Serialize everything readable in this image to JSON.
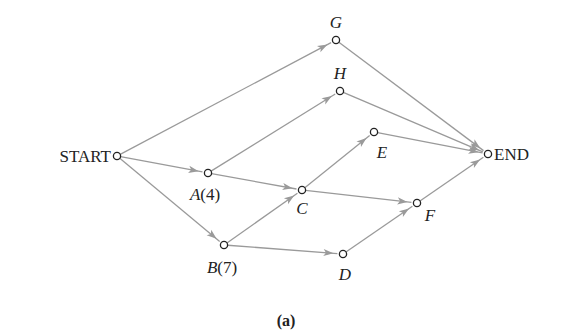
{
  "caption": "(a)",
  "colors": {
    "edge": "#9a9a9a",
    "node_stroke": "#222222",
    "text": "#222222"
  },
  "nodes": [
    {
      "id": "START",
      "label": "START",
      "x": 117,
      "y": 156,
      "lx": 111,
      "ly": 162,
      "anchor": "end",
      "italic": false
    },
    {
      "id": "G",
      "label": "G",
      "x": 336,
      "y": 40,
      "lx": 336,
      "ly": 28,
      "anchor": "middle",
      "italic": true
    },
    {
      "id": "H",
      "label": "H",
      "x": 340,
      "y": 91,
      "lx": 340,
      "ly": 79,
      "anchor": "middle",
      "italic": true
    },
    {
      "id": "E",
      "label": "E",
      "x": 374,
      "y": 132,
      "lx": 382,
      "ly": 158,
      "anchor": "middle",
      "italic": true
    },
    {
      "id": "END",
      "label": "END",
      "x": 488,
      "y": 154,
      "lx": 494,
      "ly": 160,
      "anchor": "start",
      "italic": false
    },
    {
      "id": "A",
      "label": "A",
      "weight": "(4)",
      "x": 208,
      "y": 173,
      "lx": 205,
      "ly": 200,
      "anchor": "middle",
      "italic": true
    },
    {
      "id": "C",
      "label": "C",
      "x": 302,
      "y": 190,
      "lx": 302,
      "ly": 214,
      "anchor": "middle",
      "italic": true
    },
    {
      "id": "F",
      "label": "F",
      "x": 417,
      "y": 203,
      "lx": 430,
      "ly": 221,
      "anchor": "middle",
      "italic": true
    },
    {
      "id": "B",
      "label": "B",
      "weight": "(7)",
      "x": 224,
      "y": 245,
      "lx": 222,
      "ly": 273,
      "anchor": "middle",
      "italic": true
    },
    {
      "id": "D",
      "label": "D",
      "x": 343,
      "y": 254,
      "lx": 345,
      "ly": 280,
      "anchor": "middle",
      "italic": true
    }
  ],
  "edges": [
    [
      "START",
      "G"
    ],
    [
      "START",
      "A"
    ],
    [
      "START",
      "B"
    ],
    [
      "A",
      "H"
    ],
    [
      "A",
      "C"
    ],
    [
      "B",
      "C"
    ],
    [
      "B",
      "D"
    ],
    [
      "C",
      "E"
    ],
    [
      "C",
      "F"
    ],
    [
      "D",
      "F"
    ],
    [
      "G",
      "END"
    ],
    [
      "H",
      "END"
    ],
    [
      "E",
      "END"
    ],
    [
      "F",
      "END"
    ]
  ]
}
